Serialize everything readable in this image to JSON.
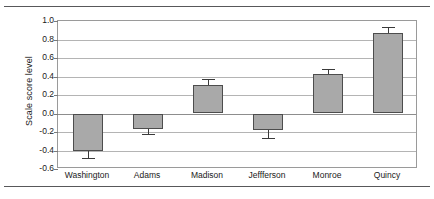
{
  "chart_data": {
    "type": "bar",
    "title": "",
    "xlabel": "",
    "ylabel": "Scale score level",
    "categories": [
      "Washington",
      "Adams",
      "Madison",
      "Jeffferson",
      "Monroe",
      "Quincy"
    ],
    "values": [
      -0.4,
      -0.17,
      0.31,
      -0.18,
      0.43,
      0.87
    ],
    "errors": [
      0.08,
      0.05,
      0.06,
      0.09,
      0.05,
      0.06
    ],
    "error_low": [
      -0.48,
      -0.22,
      0.25,
      -0.27,
      0.38,
      0.81
    ],
    "error_high": [
      -0.32,
      -0.12,
      0.37,
      -0.09,
      0.48,
      0.93
    ],
    "ylim": [
      -0.6,
      1.0
    ],
    "ytick_values": [
      1.0,
      0.8,
      0.6,
      0.4,
      0.2,
      0.0,
      -0.2,
      -0.4,
      -0.6
    ],
    "ytick_labels": [
      "1.0",
      "0.8",
      "0.6",
      "0.4",
      "0.2",
      "0.0",
      "-0.2",
      "-0.4",
      "-0.6"
    ],
    "grid": true,
    "legend": false,
    "bar_color": "#a9a9a9",
    "bar_edge_color": "#4d4d4d",
    "error_color": "#3a3a3a",
    "grid_color": "#b4b4b4",
    "frame_color": "#9a9a9a",
    "rule_color": "#58585a",
    "text_color": "#1a1a1a"
  }
}
